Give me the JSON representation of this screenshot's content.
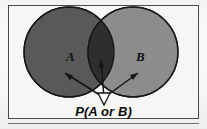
{
  "figure": {
    "kind": "venn-diagram",
    "title_caption": "P(A or B)",
    "frame": {
      "border_color": "#4a4a4a",
      "background_color": "#f6f6f4"
    },
    "background_color": "#fbfbfb",
    "baseline_rule_color": "#6f6f6f"
  },
  "sets": [
    {
      "id": "set-a",
      "label": "A",
      "fill_color": "#595959",
      "stroke_color": "#1a1a1a",
      "center_x": 69,
      "center_y": 52,
      "radius": 45
    },
    {
      "id": "set-b",
      "label": "B",
      "fill_color": "#8c8c8c",
      "stroke_color": "#1a1a1a",
      "center_x": 133,
      "center_y": 52,
      "radius": 45
    }
  ],
  "intersection": {
    "id": "set-a-and-b",
    "fill_color": "#2e2e2e",
    "stroke_color": "#1a1a1a"
  },
  "pointer": {
    "origin_x": 104,
    "origin_y": 98,
    "arrowhead_fill": "#fdfdfd",
    "arrowhead_stroke": "#141414",
    "line_color": "#141414",
    "targets": [
      {
        "id": "arrow-to-a",
        "label": "A",
        "tip_x": 66,
        "tip_y": 74
      },
      {
        "id": "arrow-to-intersection",
        "label": "A and B",
        "tip_x": 101,
        "tip_y": 62
      },
      {
        "id": "arrow-to-b",
        "label": "B",
        "tip_x": 137,
        "tip_y": 74
      }
    ]
  },
  "caption": {
    "text": "P(A or B)"
  },
  "labels": {
    "a": "A",
    "b": "B"
  }
}
